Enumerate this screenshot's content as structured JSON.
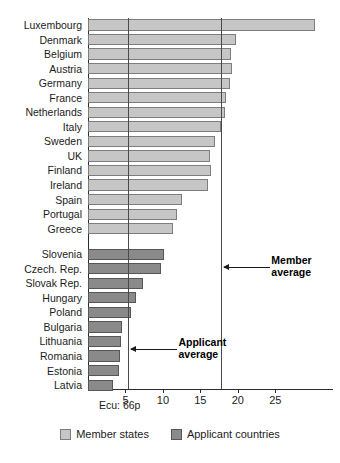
{
  "chart_data": {
    "type": "bar",
    "orientation": "horizontal",
    "title": "",
    "xlabel": "",
    "ylabel": "",
    "xlim": [
      0,
      32.7
    ],
    "ticks": [
      5,
      10,
      15,
      20,
      25
    ],
    "grid": false,
    "note": "Ecu: 66p",
    "categories": [
      "Luxembourg",
      "Denmark",
      "Belgium",
      "Austria",
      "Germany",
      "France",
      "Netherlands",
      "Italy",
      "Sweden",
      "UK",
      "Finland",
      "Ireland",
      "Spain",
      "Portugal",
      "Greece",
      "Slovenia",
      "Czech. Rep.",
      "Slovak Rep.",
      "Hungary",
      "Poland",
      "Bulgaria",
      "Lithuania",
      "Romania",
      "Estonia",
      "Latvia"
    ],
    "groups": [
      {
        "name": "Member states",
        "color": "#c6c6c6",
        "points": [
          {
            "label": "Luxembourg",
            "value": 30.3
          },
          {
            "label": "Denmark",
            "value": 19.8
          },
          {
            "label": "Belgium",
            "value": 19.1
          },
          {
            "label": "Austria",
            "value": 19.2
          },
          {
            "label": "Germany",
            "value": 18.9
          },
          {
            "label": "France",
            "value": 18.4
          },
          {
            "label": "Netherlands",
            "value": 18.3
          },
          {
            "label": "Italy",
            "value": 17.8
          },
          {
            "label": "Sweden",
            "value": 17.0
          },
          {
            "label": "UK",
            "value": 16.3
          },
          {
            "label": "Finland",
            "value": 16.4
          },
          {
            "label": "Ireland",
            "value": 16.0
          },
          {
            "label": "Spain",
            "value": 12.5
          },
          {
            "label": "Portugal",
            "value": 11.9
          },
          {
            "label": "Greece",
            "value": 11.3
          }
        ]
      },
      {
        "name": "Applicant countries",
        "color": "#8a8a8a",
        "points": [
          {
            "label": "Slovenia",
            "value": 10.2
          },
          {
            "label": "Czech. Rep.",
            "value": 9.7
          },
          {
            "label": "Slovak Rep.",
            "value": 7.3
          },
          {
            "label": "Hungary",
            "value": 6.4
          },
          {
            "label": "Poland",
            "value": 5.8
          },
          {
            "label": "Bulgaria",
            "value": 4.5
          },
          {
            "label": "Lithuania",
            "value": 4.4
          },
          {
            "label": "Romania",
            "value": 4.3
          },
          {
            "label": "Estonia",
            "value": 4.2
          },
          {
            "label": "Latvia",
            "value": 3.3
          }
        ]
      }
    ],
    "reference_lines": [
      {
        "name": "Applicant average",
        "value": 5.4,
        "label": "Applicant\naverage"
      },
      {
        "name": "Member average",
        "value": 17.8,
        "label": "Member\naverage"
      }
    ],
    "annotations": [
      {
        "id": "member-average",
        "line1": "Member",
        "line2": "average"
      },
      {
        "id": "applicant-average",
        "line1": "Applicant",
        "line2": "average"
      }
    ],
    "legend": {
      "position": "bottom",
      "entries": [
        {
          "label": "Member states",
          "color": "#c6c6c6"
        },
        {
          "label": "Applicant countries",
          "color": "#8a8a8a"
        }
      ]
    },
    "tick_labels": [
      "5",
      "10",
      "15",
      "20",
      "25"
    ]
  }
}
